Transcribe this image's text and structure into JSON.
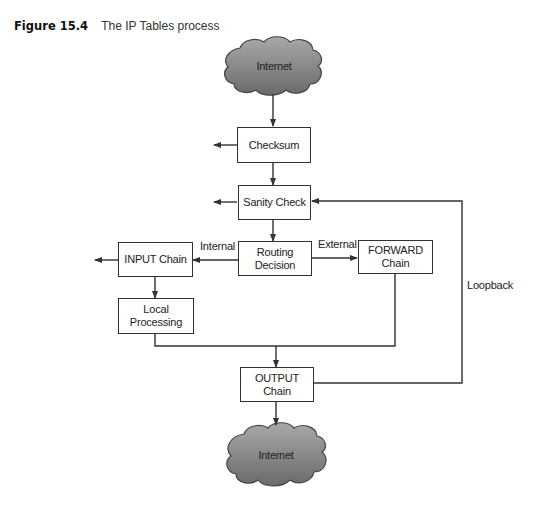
{
  "caption": {
    "figure_number": "Figure 15.4",
    "title": "The IP Tables process"
  },
  "nodes": {
    "internet_in": "Internet",
    "checksum": "Checksum",
    "sanity_check": "Sanity Check",
    "routing_decision": "Routing\nDecision",
    "input_chain": "INPUT Chain",
    "forward_chain": "FORWARD\nChain",
    "local_processing": "Local\nProcessing",
    "output_chain": "OUTPUT Chain",
    "internet_out": "Internet"
  },
  "edge_labels": {
    "internal": "Internal",
    "external": "External",
    "loopback": "Loopback"
  },
  "colors": {
    "cloud_fill_top": "#9a9a9a",
    "cloud_fill_bottom": "#6e6e6e",
    "line": "#333333"
  }
}
